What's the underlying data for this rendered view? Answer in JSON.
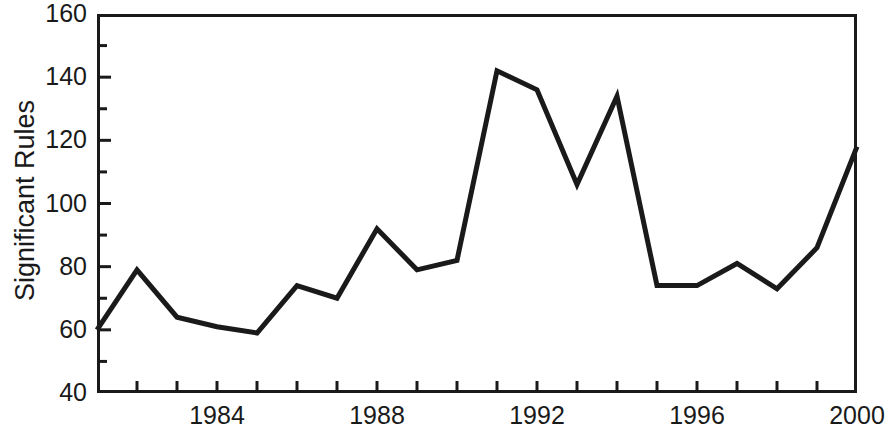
{
  "chart_data": {
    "type": "line",
    "title": "",
    "subtitle": "",
    "xlabel": "",
    "ylabel": "Significant Rules",
    "xlim": [
      1981,
      2000
    ],
    "ylim": [
      40,
      160
    ],
    "ytick_step": 20,
    "yminor_step": 10,
    "xtick_step": 1,
    "xlabel_step": 4,
    "grid": false,
    "legend": false,
    "legend_position": "none",
    "line_color": "#1a1a1a",
    "line_width": 5,
    "axis_color": "#1a1a1a",
    "background": "#ffffff",
    "x": [
      1981,
      1982,
      1983,
      1984,
      1985,
      1986,
      1987,
      1988,
      1989,
      1990,
      1991,
      1992,
      1993,
      1994,
      1995,
      1996,
      1997,
      1998,
      1999,
      2000
    ],
    "values": [
      60,
      79,
      64,
      61,
      59,
      74,
      70,
      92,
      79,
      82,
      142,
      136,
      106,
      134,
      74,
      74,
      81,
      73,
      86,
      118
    ],
    "categories": [
      "1981",
      "1982",
      "1983",
      "1984",
      "1985",
      "1986",
      "1987",
      "1988",
      "1989",
      "1990",
      "1991",
      "1992",
      "1993",
      "1994",
      "1995",
      "1996",
      "1997",
      "1998",
      "1999",
      "2000"
    ],
    "series": [
      {
        "name": "Significant Rules",
        "values": [
          60,
          79,
          64,
          61,
          59,
          74,
          70,
          92,
          79,
          82,
          142,
          136,
          106,
          134,
          74,
          74,
          81,
          73,
          86,
          118
        ]
      }
    ],
    "y_tick_labels": [
      "160",
      "140",
      "120",
      "100",
      "80",
      "60",
      "40"
    ],
    "y_tick_values": [
      160,
      140,
      120,
      100,
      80,
      60,
      40
    ],
    "x_tick_labels": [
      "1984",
      "1988",
      "1992",
      "1996",
      "2000"
    ],
    "x_tick_values": [
      1984,
      1988,
      1992,
      1996,
      2000
    ]
  }
}
